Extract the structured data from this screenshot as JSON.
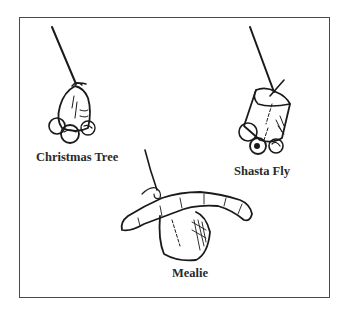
{
  "figure": {
    "type": "line-drawing",
    "ink_color": "#1a1a1a",
    "frame_color": "#4a4a4a",
    "lures": [
      {
        "id": "christmas-tree",
        "label": "Christmas Tree"
      },
      {
        "id": "shasta-fly",
        "label": "Shasta Fly"
      },
      {
        "id": "mealie",
        "label": "Mealie"
      }
    ]
  }
}
